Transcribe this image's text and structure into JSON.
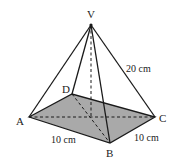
{
  "diagram": {
    "type": "square-based pyramid",
    "vertices": {
      "V": {
        "label": "V",
        "x": 91,
        "y": 25
      },
      "A": {
        "label": "A",
        "x": 29,
        "y": 117
      },
      "B": {
        "label": "B",
        "x": 110,
        "y": 143
      },
      "C": {
        "label": "C",
        "x": 155,
        "y": 117
      },
      "D": {
        "label": "D",
        "x": 72,
        "y": 94
      }
    },
    "measurements": {
      "VC": "20 cm",
      "AB": "10 cm",
      "BC": "10 cm"
    },
    "colors": {
      "base_fill": "#a9a9a9",
      "stroke": "#1a1a1a"
    }
  }
}
